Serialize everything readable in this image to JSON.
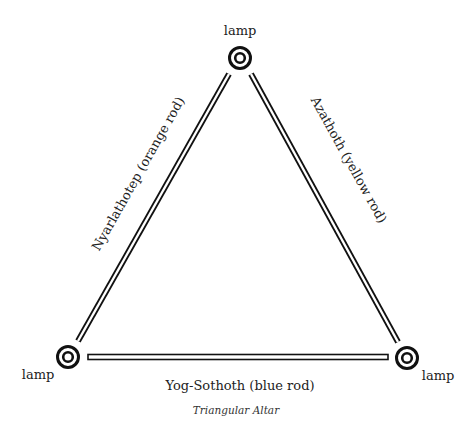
{
  "diagram": {
    "caption": "Triangular Altar",
    "lamps": [
      {
        "id": "top",
        "label": "lamp",
        "cx": 240,
        "cy": 58
      },
      {
        "id": "left",
        "label": "lamp",
        "cx": 68,
        "cy": 357
      },
      {
        "id": "right",
        "label": "lamp",
        "cx": 407,
        "cy": 358
      }
    ],
    "rods": [
      {
        "id": "left",
        "label": "Nyarlathotep (orange rod)",
        "color_name": "orange"
      },
      {
        "id": "right",
        "label": "Azathoth (yellow rod)",
        "color_name": "yellow"
      },
      {
        "id": "bottom",
        "label": "Yog-Sothoth (blue rod)",
        "color_name": "blue"
      }
    ],
    "stroke_color": "#111111",
    "background": "#ffffff"
  }
}
